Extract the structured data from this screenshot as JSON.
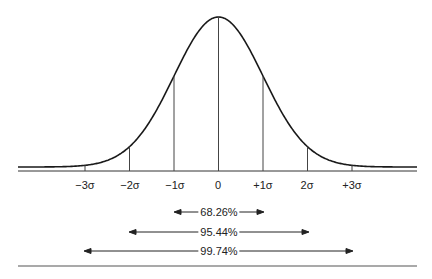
{
  "chart_data": {
    "type": "line",
    "title": "",
    "xlabel": "",
    "ylabel": "",
    "x_ticks": [
      "−3σ",
      "−2σ",
      "−1σ",
      "0",
      "+1σ",
      "2σ",
      "+3σ"
    ],
    "x_values": [
      -3,
      -2,
      -1,
      0,
      1,
      2,
      3
    ],
    "grid": false,
    "ranges": [
      {
        "label": "68.26%",
        "from": -1,
        "to": 1,
        "value": 68.26
      },
      {
        "label": "95.44%",
        "from": -2,
        "to": 2,
        "value": 95.44
      },
      {
        "label": "99.74%",
        "from": -3,
        "to": 3,
        "value": 99.74
      }
    ]
  },
  "ticks": [
    "−3σ",
    "−2σ",
    "−1σ",
    "0",
    "+1σ",
    "2σ",
    "+3σ"
  ],
  "ranges": [
    "68.26%",
    "95.44%",
    "99.74%"
  ]
}
